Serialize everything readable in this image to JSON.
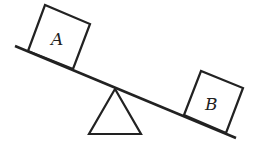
{
  "diagram": {
    "title": "",
    "boxes": [
      {
        "id": "A",
        "label": "A"
      },
      {
        "id": "B",
        "label": "B"
      }
    ],
    "stroke_color": "#222222",
    "background": "#ffffff"
  }
}
